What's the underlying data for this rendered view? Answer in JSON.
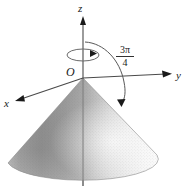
{
  "figure": {
    "background_color": "#ffffff",
    "axes": {
      "z": {
        "label": "z",
        "direction": "up",
        "arrowhead": "filled"
      },
      "y": {
        "label": "y",
        "direction": "right",
        "arrowhead": "filled"
      },
      "x": {
        "label": "x",
        "direction": "down-left",
        "arrowhead": "filled"
      }
    },
    "origin": {
      "label": "O"
    },
    "angle": {
      "numerator": "3π",
      "denominator": "4",
      "display": "3π/4",
      "arrowhead": "filled",
      "description": "arc from positive z-axis to cone surface"
    },
    "rotation_indicator": {
      "name": "spin-arrow",
      "description": "small ellipse around z-axis showing rotation about z"
    },
    "surface": {
      "name": "cone",
      "orientation": "opening downward from origin",
      "shading": {
        "left_color": "#8f8f8f",
        "mid_color": "#adadad",
        "right_color": "#efefef",
        "highlight_color": "#fbfbfb"
      }
    }
  }
}
